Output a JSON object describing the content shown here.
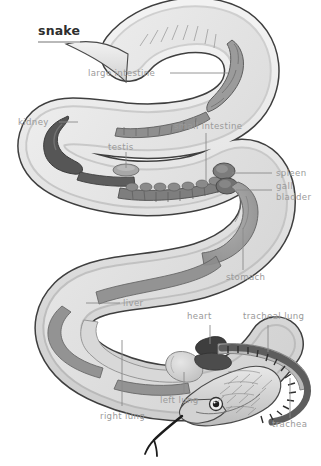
{
  "figure": {
    "title": "snake",
    "view": "lateral cutaway of coiled snake showing viscera",
    "background_color": "#ffffff",
    "label_color": "#9a9a9a",
    "title_color": "#2e2e2e",
    "leader_color": "#8a8a8a"
  },
  "labels": {
    "large_intestine": "large intestine",
    "kidney": "kidney",
    "small_intestine": "small intestine",
    "testis": "testis",
    "spleen": "spleen",
    "gall_bladder": "gall bladder",
    "stomach": "stomach",
    "liver": "liver",
    "right_lung": "right lung",
    "left_lung": "left lung",
    "heart": "heart",
    "tracheal_lung": "tracheal lung",
    "trachea": "trachea"
  },
  "organs": [
    {
      "name": "large intestine",
      "tone": "#8d8d8d"
    },
    {
      "name": "kidney",
      "tone": "#5d5d5d"
    },
    {
      "name": "small intestine",
      "tone": "#7e7e7e"
    },
    {
      "name": "testis",
      "tone": "#9b9b9b"
    },
    {
      "name": "spleen",
      "tone": "#7a7a7a"
    },
    {
      "name": "gall bladder",
      "tone": "#6f6f6f"
    },
    {
      "name": "stomach",
      "tone": "#9a9a9a"
    },
    {
      "name": "liver",
      "tone": "#8b8b8b"
    },
    {
      "name": "right lung",
      "tone": "#cfcfcf"
    },
    {
      "name": "left lung",
      "tone": "#c4c4c4"
    },
    {
      "name": "heart",
      "tone": "#4a4a4a"
    },
    {
      "name": "tracheal lung",
      "tone": "#b5b5b5"
    },
    {
      "name": "trachea",
      "tone": "#585858"
    }
  ]
}
